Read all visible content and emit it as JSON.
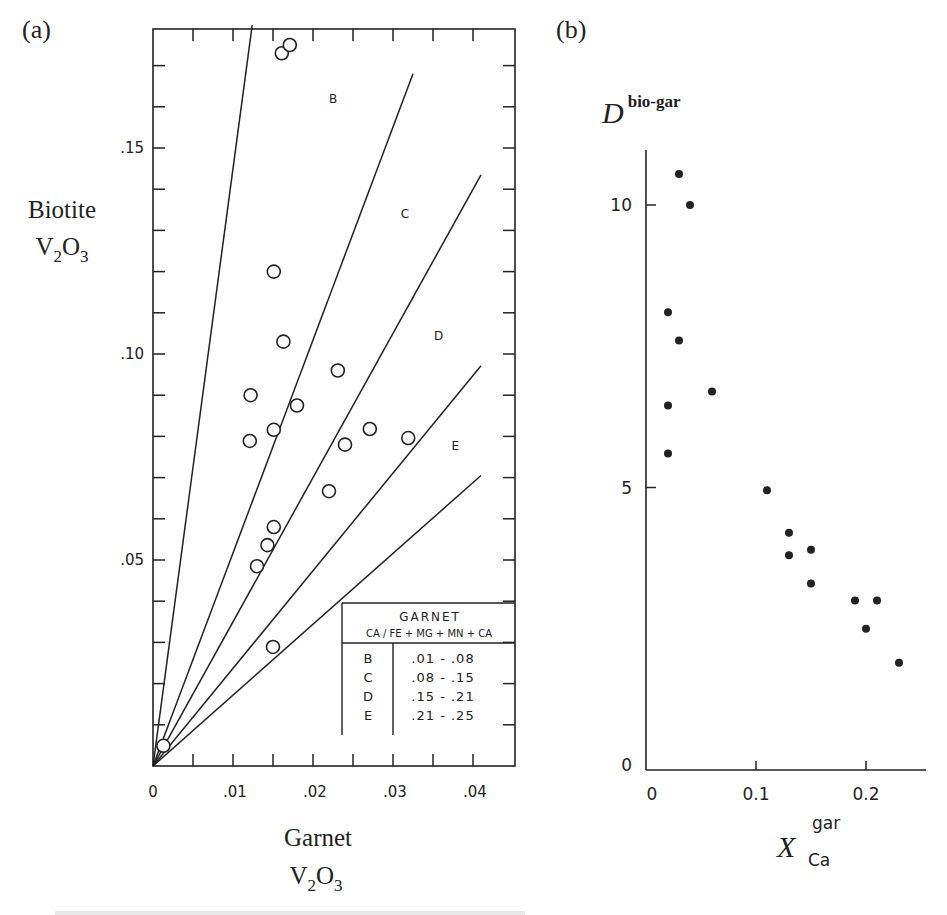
{
  "panels": [
    {
      "label": "(a)",
      "chart_data": {
        "type": "scatter",
        "title": "",
        "xlabel": "Garnet V2O3",
        "xlabel_line1": "Garnet",
        "xlabel_line2": "V",
        "xlabel_sub1": "2",
        "xlabel_mid": "O",
        "xlabel_sub2": "3",
        "ylabel": "Biotite V2O3",
        "ylabel_line1": "Biotite",
        "xlim": [
          0,
          0.045
        ],
        "ylim": [
          0,
          0.185
        ],
        "x_ticks": [
          0,
          0.005,
          0.01,
          0.015,
          0.02,
          0.025,
          0.03,
          0.035,
          0.04
        ],
        "x_tick_labels": [
          {
            "value": 0,
            "label": "0"
          },
          {
            "value": 0.01,
            "label": ".01"
          },
          {
            "value": 0.02,
            "label": ".02"
          },
          {
            "value": 0.03,
            "label": ".03"
          },
          {
            "value": 0.04,
            "label": ".04"
          }
        ],
        "y_ticks": [
          0.01,
          0.02,
          0.03,
          0.04,
          0.05,
          0.06,
          0.07,
          0.08,
          0.09,
          0.1,
          0.11,
          0.12,
          0.13,
          0.14,
          0.15,
          0.16,
          0.17
        ],
        "y_tick_labels": [
          {
            "value": 0.05,
            "label": ".05"
          },
          {
            "value": 0.1,
            "label": ".10"
          },
          {
            "value": 0.15,
            "label": ".15"
          }
        ],
        "marker": "open-circle",
        "points": [
          {
            "x": 0.0161,
            "y": 0.173
          },
          {
            "x": 0.0171,
            "y": 0.175
          },
          {
            "x": 0.0151,
            "y": 0.12
          },
          {
            "x": 0.0163,
            "y": 0.103
          },
          {
            "x": 0.0231,
            "y": 0.096
          },
          {
            "x": 0.0122,
            "y": 0.09
          },
          {
            "x": 0.018,
            "y": 0.0875
          },
          {
            "x": 0.0151,
            "y": 0.0816
          },
          {
            "x": 0.0121,
            "y": 0.0789
          },
          {
            "x": 0.024,
            "y": 0.078
          },
          {
            "x": 0.0271,
            "y": 0.0818
          },
          {
            "x": 0.0319,
            "y": 0.0796
          },
          {
            "x": 0.022,
            "y": 0.0667
          },
          {
            "x": 0.0151,
            "y": 0.058
          },
          {
            "x": 0.0143,
            "y": 0.0536
          },
          {
            "x": 0.013,
            "y": 0.0485
          },
          {
            "x": 0.015,
            "y": 0.0289
          },
          {
            "x": 0.0013,
            "y": 0.0049
          }
        ],
        "boundary_lines": [
          {
            "slope": 14.5,
            "x_end": 0.0124
          },
          {
            "slope": 5.17,
            "x_end": 0.0325
          },
          {
            "slope": 3.5,
            "x_end": 0.041
          },
          {
            "slope": 2.37,
            "x_end": 0.041
          },
          {
            "slope": 1.72,
            "x_end": 0.041
          }
        ],
        "region_labels": [
          {
            "text": "B",
            "x": 0.0225,
            "y": 0.161
          },
          {
            "text": "C",
            "x": 0.0315,
            "y": 0.133
          },
          {
            "text": "D",
            "x": 0.0357,
            "y": 0.1035
          },
          {
            "text": "E",
            "x": 0.0378,
            "y": 0.0768
          }
        ],
        "legend": {
          "title": "GARNET",
          "subtitle": "CA / FE + MG + MN + CA",
          "rows": [
            {
              "key": "B",
              "range": ".01 - .08"
            },
            {
              "key": "C",
              "range": ".08 - .15"
            },
            {
              "key": "D",
              "range": ".15 - .21"
            },
            {
              "key": "E",
              "range": ".21 - .25"
            }
          ],
          "position": "bottom-right"
        },
        "grid": false
      }
    },
    {
      "label": "(b)",
      "chart_data": {
        "type": "scatter",
        "title": "",
        "ylabel": "D^bio-gar",
        "ylabel_main": "D",
        "ylabel_sup": "bio-gar",
        "xlabel": "X_Ca^gar",
        "xlabel_main": "X",
        "xlabel_sup": "gar",
        "xlabel_sub": "Ca",
        "xlim": [
          0,
          0.26
        ],
        "ylim": [
          0,
          11
        ],
        "x_tick_labels": [
          {
            "value": 0,
            "label": "0"
          },
          {
            "value": 0.1,
            "label": "0.1"
          },
          {
            "value": 0.2,
            "label": "0.2"
          }
        ],
        "y_tick_labels": [
          {
            "value": 0,
            "label": "0"
          },
          {
            "value": 5,
            "label": "5"
          },
          {
            "value": 10,
            "label": "10"
          }
        ],
        "marker": "filled-circle",
        "points": [
          {
            "x": 0.03,
            "y": 10.55
          },
          {
            "x": 0.04,
            "y": 10.0
          },
          {
            "x": 0.02,
            "y": 8.1
          },
          {
            "x": 0.03,
            "y": 7.6
          },
          {
            "x": 0.06,
            "y": 6.7
          },
          {
            "x": 0.02,
            "y": 6.45
          },
          {
            "x": 0.02,
            "y": 5.6
          },
          {
            "x": 0.11,
            "y": 4.95
          },
          {
            "x": 0.13,
            "y": 4.2
          },
          {
            "x": 0.13,
            "y": 3.8
          },
          {
            "x": 0.15,
            "y": 3.9
          },
          {
            "x": 0.15,
            "y": 3.3
          },
          {
            "x": 0.19,
            "y": 3.0
          },
          {
            "x": 0.21,
            "y": 3.0
          },
          {
            "x": 0.2,
            "y": 2.5
          },
          {
            "x": 0.23,
            "y": 1.9
          }
        ],
        "grid": false
      }
    }
  ]
}
